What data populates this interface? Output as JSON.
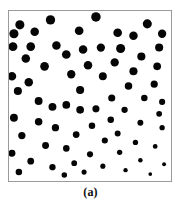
{
  "figure": {
    "caption": "(a)",
    "background_color": "#ffffff",
    "frame_color": "#9a9a9a",
    "dot_color": "#050505"
  },
  "chart_data": {
    "type": "scatter",
    "title": "(a)",
    "xlabel": "",
    "ylabel": "",
    "xlim": [
      0,
      164
    ],
    "ylim": [
      0,
      172
    ],
    "grid": false,
    "legend": "none",
    "annotations": [
      "Dot marker size decreases from upper-left to lower-right"
    ],
    "series": [
      {
        "name": "particles",
        "marker": "filled-circle",
        "color": "#050505",
        "count": 72,
        "points": [
          {
            "x": 11,
            "y": 14,
            "r": 4.6
          },
          {
            "x": 42,
            "y": 9,
            "r": 4.7
          },
          {
            "x": 88,
            "y": 6,
            "r": 4.8
          },
          {
            "x": 140,
            "y": 13,
            "r": 4.6
          },
          {
            "x": 5,
            "y": 23,
            "r": 4.6
          },
          {
            "x": 26,
            "y": 21,
            "r": 4.3
          },
          {
            "x": 71,
            "y": 20,
            "r": 4.4
          },
          {
            "x": 110,
            "y": 22,
            "r": 4.4
          },
          {
            "x": 126,
            "y": 25,
            "r": 4.3
          },
          {
            "x": 155,
            "y": 23,
            "r": 4.2
          },
          {
            "x": 4,
            "y": 36,
            "r": 4.5
          },
          {
            "x": 22,
            "y": 36,
            "r": 4.4
          },
          {
            "x": 48,
            "y": 35,
            "r": 4.3
          },
          {
            "x": 93,
            "y": 37,
            "r": 4.2
          },
          {
            "x": 113,
            "y": 38,
            "r": 4.6
          },
          {
            "x": 152,
            "y": 37,
            "r": 4.1
          },
          {
            "x": 17,
            "y": 48,
            "r": 4.3
          },
          {
            "x": 58,
            "y": 44,
            "r": 4.4
          },
          {
            "x": 75,
            "y": 39,
            "r": 4.3
          },
          {
            "x": 134,
            "y": 46,
            "r": 4.1
          },
          {
            "x": 36,
            "y": 56,
            "r": 4.4
          },
          {
            "x": 80,
            "y": 55,
            "r": 4.3
          },
          {
            "x": 107,
            "y": 52,
            "r": 4.2
          },
          {
            "x": 150,
            "y": 56,
            "r": 3.9
          },
          {
            "x": 3,
            "y": 66,
            "r": 4.3
          },
          {
            "x": 63,
            "y": 64,
            "r": 4.2
          },
          {
            "x": 95,
            "y": 66,
            "r": 4.0
          },
          {
            "x": 126,
            "y": 61,
            "r": 4.1
          },
          {
            "x": 20,
            "y": 72,
            "r": 4.3
          },
          {
            "x": 147,
            "y": 74,
            "r": 3.6
          },
          {
            "x": 9,
            "y": 81,
            "r": 4.1
          },
          {
            "x": 72,
            "y": 80,
            "r": 4.1
          },
          {
            "x": 121,
            "y": 76,
            "r": 3.8
          },
          {
            "x": 30,
            "y": 91,
            "r": 4.0
          },
          {
            "x": 104,
            "y": 88,
            "r": 3.6
          },
          {
            "x": 137,
            "y": 88,
            "r": 3.3
          },
          {
            "x": 44,
            "y": 97,
            "r": 4.0
          },
          {
            "x": 58,
            "y": 95,
            "r": 3.9
          },
          {
            "x": 155,
            "y": 92,
            "r": 3.1
          },
          {
            "x": 72,
            "y": 100,
            "r": 3.9
          },
          {
            "x": 88,
            "y": 99,
            "r": 3.6
          },
          {
            "x": 117,
            "y": 100,
            "r": 3.2
          },
          {
            "x": 5,
            "y": 108,
            "r": 4.0
          },
          {
            "x": 152,
            "y": 104,
            "r": 2.9
          },
          {
            "x": 30,
            "y": 112,
            "r": 3.8
          },
          {
            "x": 103,
            "y": 110,
            "r": 3.3
          },
          {
            "x": 133,
            "y": 113,
            "r": 3.0
          },
          {
            "x": 47,
            "y": 118,
            "r": 3.7
          },
          {
            "x": 84,
            "y": 116,
            "r": 3.3
          },
          {
            "x": 155,
            "y": 118,
            "r": 2.7
          },
          {
            "x": 13,
            "y": 126,
            "r": 3.7
          },
          {
            "x": 68,
            "y": 125,
            "r": 3.4
          },
          {
            "x": 110,
            "y": 124,
            "r": 3.0
          },
          {
            "x": 97,
            "y": 131,
            "r": 3.1
          },
          {
            "x": 128,
            "y": 133,
            "r": 2.7
          },
          {
            "x": 37,
            "y": 136,
            "r": 3.5
          },
          {
            "x": 58,
            "y": 139,
            "r": 3.3
          },
          {
            "x": 148,
            "y": 137,
            "r": 2.4
          },
          {
            "x": 3,
            "y": 144,
            "r": 3.5
          },
          {
            "x": 82,
            "y": 145,
            "r": 3.1
          },
          {
            "x": 112,
            "y": 143,
            "r": 2.7
          },
          {
            "x": 22,
            "y": 152,
            "r": 3.4
          },
          {
            "x": 66,
            "y": 154,
            "r": 2.9
          },
          {
            "x": 133,
            "y": 151,
            "r": 2.3
          },
          {
            "x": 44,
            "y": 158,
            "r": 3.2
          },
          {
            "x": 95,
            "y": 157,
            "r": 2.6
          },
          {
            "x": 157,
            "y": 155,
            "r": 2.0
          },
          {
            "x": 10,
            "y": 163,
            "r": 3.3
          },
          {
            "x": 76,
            "y": 163,
            "r": 2.6
          },
          {
            "x": 118,
            "y": 161,
            "r": 2.2
          },
          {
            "x": 143,
            "y": 165,
            "r": 1.9
          },
          {
            "x": 56,
            "y": 166,
            "r": 2.8
          }
        ]
      }
    ]
  }
}
